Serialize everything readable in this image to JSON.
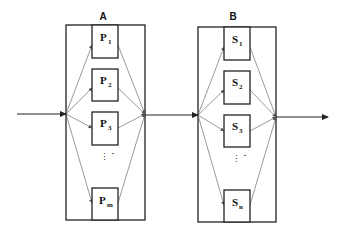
{
  "diagram": {
    "type": "two-stage parallel flow",
    "stages": [
      {
        "label": "A",
        "nodes": [
          {
            "base": "P",
            "sub": "1"
          },
          {
            "base": "P",
            "sub": "2"
          },
          {
            "base": "P",
            "sub": "3"
          },
          {
            "base": "P",
            "sub": "m"
          }
        ],
        "ellipsis": "⋮",
        "dash": "-"
      },
      {
        "label": "B",
        "nodes": [
          {
            "base": "S",
            "sub": "1"
          },
          {
            "base": "S",
            "sub": "2"
          },
          {
            "base": "S",
            "sub": "3"
          },
          {
            "base": "S",
            "sub": "n"
          }
        ],
        "ellipsis": "⋮",
        "dash": "-"
      }
    ],
    "connections": [
      "input → A",
      "A → B",
      "B → output"
    ],
    "colors": {
      "line": "#222222",
      "fan_line": "#555555",
      "background": "#ffffff"
    }
  }
}
